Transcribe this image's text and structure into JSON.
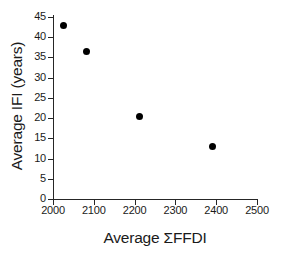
{
  "chart_data": {
    "type": "scatter",
    "title": "",
    "xlabel": "Average ΣFFDI",
    "ylabel": "Average IFI (years)",
    "xlim": [
      2000,
      2500
    ],
    "ylim": [
      0,
      45
    ],
    "grid": false,
    "legend": false,
    "marker": {
      "shape": "circle",
      "color": "#000000",
      "size_px": 7
    },
    "axis_color": "#262626",
    "background": "#ffffff",
    "xticks": [
      2000,
      2100,
      2200,
      2300,
      2400,
      2500
    ],
    "xtick_labels": [
      "2000",
      "2100",
      "2200",
      "2300",
      "2400",
      "2500"
    ],
    "yticks": [
      0,
      5,
      10,
      15,
      20,
      25,
      30,
      35,
      40,
      45
    ],
    "ytick_labels": [
      "0",
      "5",
      "10",
      "15",
      "20",
      "25",
      "30",
      "35",
      "40",
      "45"
    ],
    "x": [
      2025,
      2081,
      2211,
      2392
    ],
    "y": [
      43,
      36.5,
      20.5,
      13
    ],
    "points": [
      {
        "x": 2025,
        "y": 43
      },
      {
        "x": 2081,
        "y": 36.5
      },
      {
        "x": 2211,
        "y": 20.5
      },
      {
        "x": 2392,
        "y": 13
      }
    ]
  }
}
